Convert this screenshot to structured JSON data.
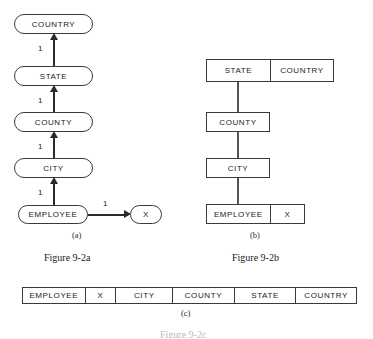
{
  "figure": {
    "panels": [
      {
        "id": "a",
        "sublabel": "(a)",
        "caption": "Figure 9-2a",
        "style": "rounded-nodes-with-arrows",
        "nodes": [
          {
            "label": "COUNTRY"
          },
          {
            "label": "STATE"
          },
          {
            "label": "COUNTY"
          },
          {
            "label": "CITY"
          },
          {
            "label": "EMPLOYEE"
          },
          {
            "label": "X"
          }
        ],
        "edges": [
          {
            "from": "STATE",
            "to": "COUNTRY",
            "label": "1",
            "direction": "up"
          },
          {
            "from": "COUNTY",
            "to": "STATE",
            "label": "1",
            "direction": "up"
          },
          {
            "from": "CITY",
            "to": "COUNTY",
            "label": "1",
            "direction": "up"
          },
          {
            "from": "EMPLOYEE",
            "to": "CITY",
            "label": "1",
            "direction": "up"
          },
          {
            "from": "EMPLOYEE",
            "to": "X",
            "label": "1",
            "direction": "right"
          }
        ]
      },
      {
        "id": "b",
        "sublabel": "(b)",
        "caption": "Figure 9-2b",
        "style": "record-boxes-with-links",
        "rows": [
          {
            "cells": [
              "STATE",
              "COUNTRY"
            ]
          },
          {
            "cells": [
              "COUNTY"
            ]
          },
          {
            "cells": [
              "CITY"
            ]
          },
          {
            "cells": [
              "EMPLOYEE",
              "X"
            ]
          }
        ]
      },
      {
        "id": "c",
        "sublabel": "(c)",
        "caption": "Figure 9-2c",
        "style": "single-flat-record",
        "cells": [
          "EMPLOYEE",
          "X",
          "CITY",
          "COUNTY",
          "STATE",
          "COUNTRY"
        ]
      }
    ]
  },
  "colors": {
    "stroke": "#3a3a3a",
    "connector": "#2a2a2a",
    "background": "#ffffff",
    "text": "#1a1a1a"
  }
}
